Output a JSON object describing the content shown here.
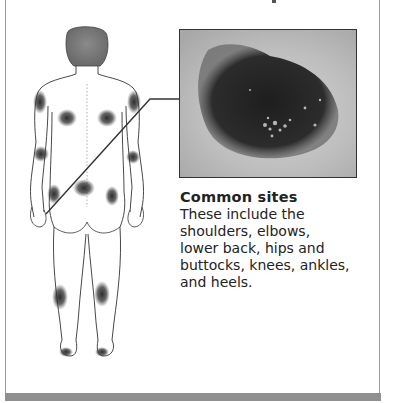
{
  "figure": {
    "illustration": "back-view-human-body-pressure-sites",
    "pressure_sites_marked": [
      "shoulders",
      "elbows",
      "lower back",
      "hips",
      "buttocks",
      "knees",
      "ankles",
      "heels"
    ]
  },
  "photo": {
    "subject": "pressure-ulcer-closeup"
  },
  "caption": {
    "title": "Common sites",
    "body": "These include the\nshoulders, elbows,\nlower back, hips and\nbuttocks, knees, ankles,\nand heels."
  },
  "colors": {
    "border": "#9a9a9a",
    "bottom_bar": "#8f8f8f",
    "text": "#222222",
    "spot": "#2a2a2a"
  }
}
